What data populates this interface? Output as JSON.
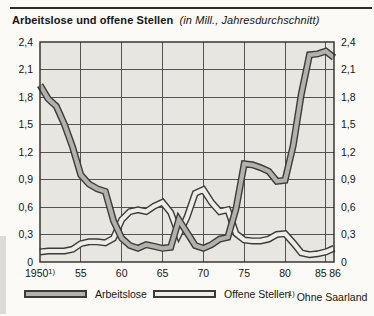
{
  "colors": {
    "plot_bg": "#e8e6e1",
    "grid": "#55534f",
    "border": "#2b2a26",
    "band_outline": "#3c3b37",
    "axis_text": "#151515"
  },
  "legend": {
    "footnote_marker": "1)",
    "footnote_text": "Ohne Saarland"
  },
  "chart_data": {
    "type": "line",
    "title": "Arbeitslose und offene Stellen",
    "subtitle": "(in Mill., Jahresdurchschnitt)",
    "ylim": [
      0,
      2.4
    ],
    "ytick_step": 0.3,
    "ytick_labels": [
      "0",
      "0,3",
      "0,6",
      "0,9",
      "1,2",
      "1,5",
      "1,8",
      "2,1",
      "2,4"
    ],
    "grid": true,
    "legend_position": "bottom",
    "years": [
      1950,
      1951,
      1952,
      1953,
      1954,
      1955,
      1956,
      1957,
      1958,
      1959,
      1960,
      1961,
      1962,
      1963,
      1964,
      1965,
      1966,
      1967,
      1968,
      1969,
      1970,
      1971,
      1972,
      1973,
      1974,
      1975,
      1976,
      1977,
      1978,
      1979,
      1980,
      1981,
      1982,
      1983,
      1984,
      1985,
      1986
    ],
    "xticks": [
      {
        "year": 1950,
        "label": "1950",
        "sup": "1)"
      },
      {
        "year": 1955,
        "label": "55"
      },
      {
        "year": 1960,
        "label": "60"
      },
      {
        "year": 1965,
        "label": "65"
      },
      {
        "year": 1970,
        "label": "70"
      },
      {
        "year": 1975,
        "label": "75"
      },
      {
        "year": 1980,
        "label": "80"
      },
      {
        "year": 1985,
        "label": "85"
      },
      {
        "year": 1986,
        "label": "86"
      }
    ],
    "series": [
      {
        "name": "Arbeitslose",
        "fill": "#b3b1ac",
        "values": [
          1.93,
          1.78,
          1.7,
          1.5,
          1.25,
          0.95,
          0.85,
          0.8,
          0.77,
          0.45,
          0.26,
          0.18,
          0.15,
          0.19,
          0.17,
          0.15,
          0.16,
          0.46,
          0.32,
          0.18,
          0.15,
          0.19,
          0.25,
          0.27,
          0.58,
          1.07,
          1.06,
          1.03,
          0.99,
          0.88,
          0.89,
          1.27,
          1.83,
          2.26,
          2.27,
          2.3,
          2.23
        ]
      },
      {
        "name": "Offene Stellen",
        "fill": "#efede8",
        "values": [
          0.11,
          0.12,
          0.12,
          0.12,
          0.14,
          0.2,
          0.22,
          0.22,
          0.21,
          0.26,
          0.46,
          0.55,
          0.57,
          0.55,
          0.61,
          0.65,
          0.54,
          0.3,
          0.49,
          0.75,
          0.79,
          0.65,
          0.55,
          0.57,
          0.31,
          0.24,
          0.23,
          0.23,
          0.25,
          0.3,
          0.31,
          0.21,
          0.1,
          0.08,
          0.09,
          0.11,
          0.15
        ]
      }
    ]
  }
}
